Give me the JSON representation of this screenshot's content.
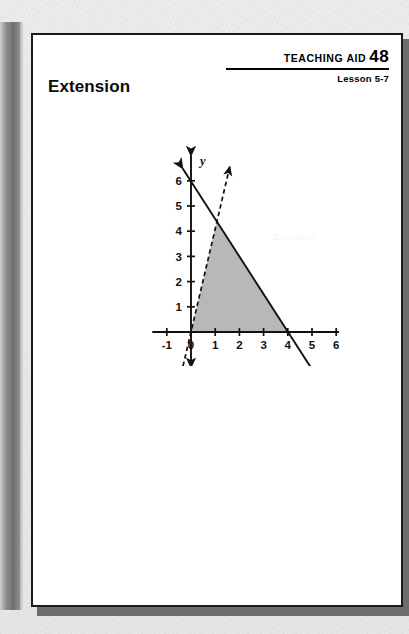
{
  "document": {
    "header": {
      "aid_words": "TEACHING AID",
      "aid_number": "48",
      "lesson": "Lesson 5-7"
    },
    "title": "Extension",
    "watermark": "Exercise"
  },
  "chart_data": {
    "type": "line",
    "title": "",
    "xlabel": "x",
    "ylabel": "y",
    "xlim": [
      -1.6,
      6.9
    ],
    "ylim": [
      -1.4,
      7.0
    ],
    "xticks": [
      -1,
      0,
      1,
      2,
      3,
      4,
      5,
      6
    ],
    "xtick_labels": [
      "-1",
      "0",
      "1",
      "2",
      "3",
      "4",
      "5",
      "6"
    ],
    "yticks": [
      1,
      2,
      3,
      4,
      5,
      6
    ],
    "ytick_labels": [
      "1",
      "2",
      "3",
      "4",
      "5",
      "6"
    ],
    "grid": false,
    "legend": "none",
    "series": [
      {
        "name": "solid-boundary-line",
        "style": "solid",
        "arrows": "both",
        "equation": "y = 6 - 1.5x",
        "points": [
          [
            -0.35,
            6.5
          ],
          [
            0,
            6
          ],
          [
            4,
            0
          ],
          [
            5.35,
            -2.0
          ]
        ]
      },
      {
        "name": "dashed-boundary-line",
        "style": "dashed",
        "arrows": "both",
        "equation": "y = 4.1x",
        "points": [
          [
            -0.33,
            -1.35
          ],
          [
            0,
            0
          ],
          [
            1.07,
            4.4
          ],
          [
            1.6,
            6.55
          ]
        ]
      }
    ],
    "shaded_region": {
      "name": "solution-region",
      "fill": "#9c9c9c",
      "vertices": [
        [
          0,
          0
        ],
        [
          4,
          0
        ],
        [
          1.07,
          4.4
        ]
      ]
    }
  }
}
